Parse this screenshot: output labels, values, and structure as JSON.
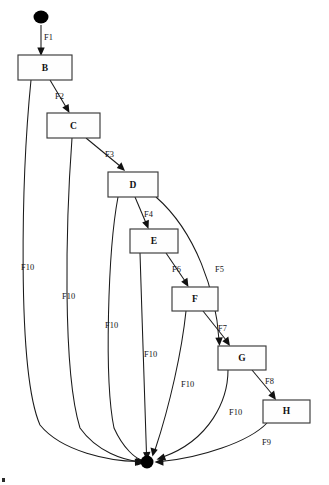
{
  "diagram": {
    "type": "state-transition-diagram",
    "background_color": "#ffffff",
    "line_color": "#1a1a1a",
    "node_fill": "#fefefe",
    "node_stroke": "#3a3a3a",
    "terminal_color": "#000000",
    "start_node": {
      "name": "start-node",
      "shape": "filled-ellipse",
      "cx": 41,
      "cy": 17,
      "rx": 7.5,
      "ry": 6.5
    },
    "end_node": {
      "name": "end-node",
      "shape": "filled-circle",
      "cx": 147,
      "cy": 462,
      "r": 6.5
    },
    "nodes": [
      {
        "id": "B",
        "label": "B",
        "x": 18,
        "y": 55,
        "w": 54,
        "h": 25
      },
      {
        "id": "C",
        "label": "C",
        "x": 47,
        "y": 113,
        "w": 53,
        "h": 25
      },
      {
        "id": "D",
        "label": "D",
        "x": 108,
        "y": 172,
        "w": 50,
        "h": 25
      },
      {
        "id": "E",
        "label": "E",
        "x": 130,
        "y": 229,
        "w": 48,
        "h": 24
      },
      {
        "id": "F",
        "label": "F",
        "x": 172,
        "y": 287,
        "w": 46,
        "h": 24
      },
      {
        "id": "G",
        "label": "G",
        "x": 218,
        "y": 346,
        "w": 48,
        "h": 24
      },
      {
        "id": "H",
        "label": "H",
        "x": 263,
        "y": 400,
        "w": 47,
        "h": 23
      }
    ],
    "edges": [
      {
        "id": "F1",
        "label": "F1",
        "from": "start",
        "to": "B",
        "label_x": 44,
        "label_y": 38
      },
      {
        "id": "F2",
        "label": "F2",
        "from": "B",
        "to": "C",
        "label_x": 55,
        "label_y": 97
      },
      {
        "id": "F3",
        "label": "F3",
        "from": "C",
        "to": "D",
        "label_x": 105,
        "label_y": 155
      },
      {
        "id": "F4",
        "label": "F4",
        "from": "D",
        "to": "E",
        "label_x": 144,
        "label_y": 215
      },
      {
        "id": "F5",
        "label": "F5",
        "from": "D",
        "to": "G",
        "label_x": 215,
        "label_y": 270
      },
      {
        "id": "F6",
        "label": "F6",
        "from": "E",
        "to": "F",
        "label_x": 172,
        "label_y": 270
      },
      {
        "id": "F7",
        "label": "F7",
        "from": "F",
        "to": "G",
        "label_x": 218,
        "label_y": 329
      },
      {
        "id": "F8",
        "label": "F8",
        "from": "G",
        "to": "H",
        "label_x": 265,
        "label_y": 382
      },
      {
        "id": "F9",
        "label": "F9",
        "from": "H",
        "to": "end",
        "label_x": 262,
        "label_y": 443
      },
      {
        "id": "F10-B",
        "label": "F10",
        "from": "B",
        "to": "end",
        "label_x": 21,
        "label_y": 268
      },
      {
        "id": "F10-C",
        "label": "F10",
        "from": "C",
        "to": "end",
        "label_x": 62,
        "label_y": 297
      },
      {
        "id": "F10-D",
        "label": "F10",
        "from": "D",
        "to": "end",
        "label_x": 105,
        "label_y": 326
      },
      {
        "id": "F10-E",
        "label": "F10",
        "from": "E",
        "to": "end",
        "label_x": 144,
        "label_y": 355
      },
      {
        "id": "F10-F",
        "label": "F10",
        "from": "F",
        "to": "end",
        "label_x": 181,
        "label_y": 385
      },
      {
        "id": "F10-G",
        "label": "F10",
        "from": "G",
        "to": "end",
        "label_x": 229,
        "label_y": 413
      }
    ]
  }
}
